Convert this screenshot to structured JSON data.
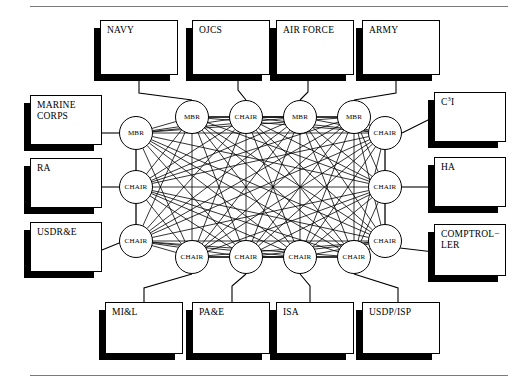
{
  "figure": {
    "stroke_color": "#000000",
    "background_color": "#ffffff",
    "rule_color": "#7a7a7a"
  },
  "rules": {
    "top_label": "top-horizontal-rule",
    "bottom_label": "bottom-horizontal-rule"
  },
  "boxes": [
    {
      "id": "navy",
      "label": "NAVY",
      "x": 100,
      "y": 20,
      "w": 78,
      "h": 55
    },
    {
      "id": "ojcs",
      "label": "OJCS",
      "x": 192,
      "y": 20,
      "w": 78,
      "h": 55
    },
    {
      "id": "airforce",
      "label": "AIR FORCE",
      "x": 276,
      "y": 20,
      "w": 78,
      "h": 55
    },
    {
      "id": "army",
      "label": "ARMY",
      "x": 362,
      "y": 20,
      "w": 78,
      "h": 55
    },
    {
      "id": "marinecorps",
      "label": "MARINE\nCORPS",
      "x": 30,
      "y": 95,
      "w": 72,
      "h": 50
    },
    {
      "id": "ra",
      "label": "RA",
      "x": 30,
      "y": 158,
      "w": 72,
      "h": 50
    },
    {
      "id": "usdre",
      "label": "USDR&E",
      "x": 30,
      "y": 222,
      "w": 72,
      "h": 50
    },
    {
      "id": "c3i",
      "label": "C3I",
      "x": 434,
      "y": 92,
      "w": 72,
      "h": 50,
      "html": true
    },
    {
      "id": "ha",
      "label": "HA",
      "x": 434,
      "y": 157,
      "w": 72,
      "h": 50
    },
    {
      "id": "comptroller",
      "label": "COMPTROL−\nLER",
      "x": 434,
      "y": 224,
      "w": 72,
      "h": 52
    },
    {
      "id": "mil",
      "label": "MI&L",
      "x": 105,
      "y": 302,
      "w": 78,
      "h": 52
    },
    {
      "id": "pae",
      "label": "PA&E",
      "x": 192,
      "y": 302,
      "w": 78,
      "h": 52
    },
    {
      "id": "isa",
      "label": "ISA",
      "x": 276,
      "y": 302,
      "w": 78,
      "h": 52
    },
    {
      "id": "usdpisp",
      "label": "USDP/ISP",
      "x": 362,
      "y": 302,
      "w": 78,
      "h": 52
    }
  ],
  "circles": [
    {
      "id": "c-top-1",
      "label": "MBR",
      "cx": 192,
      "cy": 117,
      "r": 17,
      "row": "top"
    },
    {
      "id": "c-top-2",
      "label": "CHAIR",
      "cx": 246,
      "cy": 117,
      "r": 17,
      "row": "top"
    },
    {
      "id": "c-top-3",
      "label": "MBR",
      "cx": 300,
      "cy": 117,
      "r": 17,
      "row": "top"
    },
    {
      "id": "c-top-4",
      "label": "MBR",
      "cx": 354,
      "cy": 117,
      "r": 17,
      "row": "top"
    },
    {
      "id": "c-left-1",
      "label": "MBR",
      "cx": 136,
      "cy": 133,
      "r": 17,
      "row": "left"
    },
    {
      "id": "c-left-2",
      "label": "CHAIR",
      "cx": 136,
      "cy": 187,
      "r": 17,
      "row": "left"
    },
    {
      "id": "c-left-3",
      "label": "CHAIR",
      "cx": 136,
      "cy": 241,
      "r": 17,
      "row": "left"
    },
    {
      "id": "c-right-1",
      "label": "CHAIR",
      "cx": 385,
      "cy": 133,
      "r": 17,
      "row": "right"
    },
    {
      "id": "c-right-2",
      "label": "CHAIR",
      "cx": 385,
      "cy": 187,
      "r": 17,
      "row": "right"
    },
    {
      "id": "c-right-3",
      "label": "CHAIR",
      "cx": 385,
      "cy": 241,
      "r": 17,
      "row": "right"
    },
    {
      "id": "c-bot-1",
      "label": "CHAIR",
      "cx": 192,
      "cy": 257,
      "r": 17,
      "row": "bottom"
    },
    {
      "id": "c-bot-2",
      "label": "CHAIR",
      "cx": 246,
      "cy": 257,
      "r": 17,
      "row": "bottom"
    },
    {
      "id": "c-bot-3",
      "label": "CHAIR",
      "cx": 300,
      "cy": 257,
      "r": 17,
      "row": "bottom"
    },
    {
      "id": "c-bot-4",
      "label": "CHAIR",
      "cx": 354,
      "cy": 257,
      "r": 17,
      "row": "bottom"
    }
  ],
  "connectors": [
    {
      "id": "k-navy",
      "box": "navy",
      "circle": "c-top-1",
      "points": "139,75 139,93 192,100"
    },
    {
      "id": "k-ojcs",
      "box": "ojcs",
      "circle": "c-top-2",
      "points": "238,75 238,90 246,100"
    },
    {
      "id": "k-airforce",
      "box": "airforce",
      "circle": "c-top-3",
      "points": "308,75 308,92 300,100"
    },
    {
      "id": "k-army",
      "box": "army",
      "circle": "c-top-4",
      "points": "396,75 396,93 354,100"
    },
    {
      "id": "k-marinecorps",
      "box": "marinecorps",
      "circle": "c-left-1",
      "points": "102,133 119,133"
    },
    {
      "id": "k-ra",
      "box": "ra",
      "circle": "c-left-2",
      "points": "102,187 119,187"
    },
    {
      "id": "k-usdre",
      "box": "usdre",
      "circle": "c-left-3",
      "points": "102,250 124,241"
    },
    {
      "id": "k-c3i",
      "box": "c3i",
      "circle": "c-right-1",
      "points": "402,133 434,117"
    },
    {
      "id": "k-ha",
      "box": "ha",
      "circle": "c-right-2",
      "points": "402,187 434,187"
    },
    {
      "id": "k-comptroller",
      "box": "comptroller",
      "circle": "c-right-3",
      "points": "400,248 434,252"
    },
    {
      "id": "k-mil",
      "box": "mil",
      "circle": "c-bot-1",
      "points": "144,302 144,288 192,274"
    },
    {
      "id": "k-pae",
      "box": "pae",
      "circle": "c-bot-2",
      "points": "232,302 232,286 246,274"
    },
    {
      "id": "k-isa",
      "box": "isa",
      "circle": "c-bot-3",
      "points": "310,302 310,286 300,274"
    },
    {
      "id": "k-usdpisp",
      "box": "usdpisp",
      "circle": "c-bot-4",
      "points": "398,302 398,288 354,274"
    }
  ],
  "mesh": {
    "description": "fully-connected mesh among all 14 circle nodes",
    "node_count": 14,
    "edge_count": 91,
    "complete_graph": true,
    "stroke_width": 0.8
  }
}
